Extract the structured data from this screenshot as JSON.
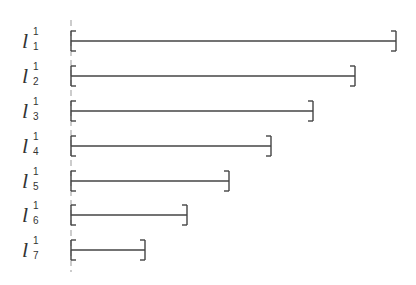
{
  "diagram": {
    "title": "",
    "axis_x": 71,
    "line_color": "#444444",
    "rows": [
      {
        "label": "l",
        "superscript": "1",
        "subscript": "1",
        "y": 41,
        "x_end": 396
      },
      {
        "label": "l",
        "superscript": "1",
        "subscript": "2",
        "y": 76,
        "x_end": 355
      },
      {
        "label": "l",
        "superscript": "1",
        "subscript": "3",
        "y": 111,
        "x_end": 313
      },
      {
        "label": "l",
        "superscript": "1",
        "subscript": "4",
        "y": 146,
        "x_end": 271
      },
      {
        "label": "l",
        "superscript": "1",
        "subscript": "5",
        "y": 181,
        "x_end": 229
      },
      {
        "label": "l",
        "superscript": "1",
        "subscript": "6",
        "y": 215,
        "x_end": 187
      },
      {
        "label": "l",
        "superscript": "1",
        "subscript": "7",
        "y": 250,
        "x_end": 145
      }
    ]
  }
}
